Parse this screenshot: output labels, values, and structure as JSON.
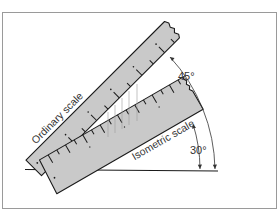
{
  "figure": {
    "labels": {
      "ordinary_scale": "Ordinary scale",
      "isometric_scale": "Isometric scale",
      "angle_45": "45°",
      "angle_30": "30°"
    },
    "angles_deg": {
      "ordinary": 45,
      "isometric": 30
    },
    "colors": {
      "ruler_fill": "#c9c9c9",
      "outline": "#1a1a1a",
      "frame": "#9a9a9a",
      "projection_lines": "#9a9a9a"
    }
  }
}
